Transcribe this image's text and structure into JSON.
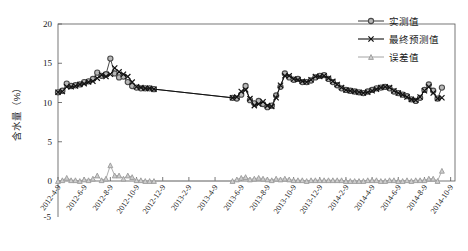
{
  "chart_data": {
    "type": "line",
    "title": "",
    "xlabel": "",
    "ylabel": "含水量（%）",
    "ylim": [
      -5,
      20
    ],
    "yticks": [
      -5,
      0,
      5,
      10,
      15,
      20
    ],
    "ytick_labels": [
      "-5",
      "0",
      "5",
      "10",
      "15",
      "20"
    ],
    "grid": false,
    "legend_position": "top-right",
    "xtick_labels": [
      "2012-4-9",
      "2012-6-9",
      "2012-8-9",
      "2012-10-9",
      "2012-12-9",
      "2013-2-9",
      "2013-4-9",
      "2013-6-9",
      "2013-8-9",
      "2013-10-9",
      "2013-12-9",
      "2014-2-9",
      "2014-4-9",
      "2014-6-9",
      "2014-8-9",
      "2014-10-9"
    ],
    "x_index_of_ticks": [
      0,
      6,
      12,
      18,
      24,
      30,
      36,
      42,
      48,
      54,
      60,
      66,
      72,
      78,
      84,
      90
    ],
    "x": [
      0,
      1,
      2,
      3,
      4,
      5,
      6,
      7,
      8,
      9,
      10,
      11,
      12,
      13,
      14,
      15,
      16,
      17,
      18,
      19,
      20,
      21,
      22,
      40,
      41,
      42,
      43,
      44,
      45,
      46,
      47,
      48,
      49,
      50,
      51,
      52,
      53,
      54,
      55,
      56,
      57,
      58,
      59,
      60,
      61,
      62,
      63,
      64,
      65,
      66,
      67,
      68,
      69,
      70,
      71,
      72,
      73,
      74,
      75,
      76,
      77,
      78,
      79,
      80,
      81,
      82,
      83,
      84,
      85,
      86,
      87,
      88
    ],
    "series": [
      {
        "name": "实测值",
        "marker": "circle",
        "color": "#4a4a4a",
        "values": [
          11.3,
          11.5,
          12.4,
          12.1,
          12.2,
          12.3,
          12.6,
          12.7,
          13.0,
          13.8,
          13.4,
          13.6,
          15.6,
          13.7,
          13.2,
          13.3,
          12.6,
          12.1,
          11.9,
          11.8,
          11.8,
          11.8,
          11.7,
          10.6,
          10.5,
          11.0,
          12.1,
          10.3,
          9.9,
          10.2,
          9.8,
          9.4,
          9.6,
          10.9,
          12.0,
          13.7,
          13.2,
          12.9,
          13.0,
          12.6,
          12.6,
          12.8,
          13.2,
          13.4,
          13.5,
          13.0,
          12.6,
          12.2,
          11.8,
          11.6,
          11.5,
          11.4,
          11.3,
          11.2,
          11.4,
          11.6,
          11.8,
          11.9,
          12.0,
          11.8,
          11.4,
          11.2,
          11.0,
          10.8,
          10.4,
          10.2,
          10.6,
          11.6,
          12.3,
          11.5,
          10.5,
          11.9
        ]
      },
      {
        "name": "最终预测值",
        "marker": "x",
        "color": "#111111",
        "values": [
          11.3,
          11.4,
          12.0,
          12.0,
          12.1,
          12.3,
          12.4,
          12.6,
          12.7,
          13.1,
          13.5,
          13.3,
          13.6,
          14.4,
          13.9,
          13.6,
          13.3,
          12.6,
          12.0,
          11.9,
          11.8,
          11.8,
          11.7,
          10.6,
          10.7,
          11.4,
          11.6,
          10.5,
          9.6,
          9.8,
          10.1,
          9.6,
          9.5,
          10.6,
          12.2,
          13.4,
          13.4,
          13.0,
          12.9,
          12.7,
          12.6,
          12.9,
          13.3,
          13.3,
          13.4,
          13.1,
          12.7,
          12.3,
          11.9,
          11.6,
          11.5,
          11.4,
          11.3,
          11.2,
          11.3,
          11.5,
          11.7,
          11.9,
          12.0,
          11.9,
          11.5,
          11.2,
          11.0,
          10.7,
          10.4,
          10.3,
          10.7,
          11.5,
          12.0,
          11.2,
          10.5,
          10.6
        ]
      },
      {
        "name": "误差值",
        "marker": "triangle",
        "color": "#9a9a9a",
        "values": [
          0.0,
          0.1,
          0.4,
          0.1,
          0.1,
          0.0,
          0.2,
          0.1,
          0.3,
          0.7,
          0.1,
          0.3,
          2.0,
          0.7,
          0.7,
          0.3,
          0.7,
          0.5,
          0.1,
          0.1,
          0.0,
          0.0,
          0.0,
          0.0,
          0.2,
          0.4,
          0.5,
          0.2,
          0.3,
          0.4,
          0.3,
          0.2,
          0.1,
          0.3,
          0.2,
          0.3,
          0.2,
          0.1,
          0.1,
          0.1,
          0.0,
          0.1,
          0.1,
          0.1,
          0.1,
          0.1,
          0.1,
          0.1,
          0.1,
          0.0,
          0.0,
          0.0,
          0.0,
          0.0,
          0.1,
          0.1,
          0.1,
          0.0,
          0.0,
          0.1,
          0.1,
          0.0,
          0.0,
          0.1,
          0.0,
          0.1,
          0.1,
          0.1,
          0.3,
          0.3,
          0.0,
          1.3
        ]
      }
    ]
  },
  "legend": {
    "items": [
      {
        "label": "实测值"
      },
      {
        "label": "最终预测值"
      },
      {
        "label": "误差值"
      }
    ]
  }
}
